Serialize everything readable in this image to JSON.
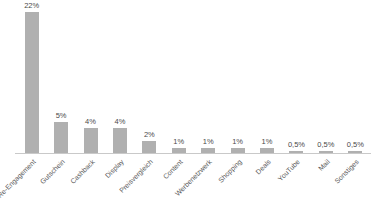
{
  "chart_data": {
    "type": "bar",
    "title": "",
    "subtitle": "",
    "xlabel": "",
    "ylabel": "",
    "grid": false,
    "legend": false,
    "ylim": [
      0,
      23
    ],
    "categories": [
      "Re-Engagement",
      "Gutschein",
      "Cashback",
      "Display",
      "Preisvergleich",
      "Content",
      "Werbenetzwerk",
      "Shopping",
      "Deals",
      "YouTube",
      "Mail",
      "Sonstiges"
    ],
    "values": [
      22,
      5,
      4,
      4,
      2,
      1,
      1,
      1,
      1,
      0.5,
      0.5,
      0.5
    ],
    "data_labels": [
      "22%",
      "5%",
      "4%",
      "4%",
      "2%",
      "1%",
      "1%",
      "1%",
      "1%",
      "0,5%",
      "0,5%",
      "0,5%"
    ],
    "colors": {
      "bar": "#b0b0b0",
      "axis": "#c9c9c9",
      "label_text": "#4a4a4a",
      "tick_text": "#5a5a5a",
      "background": "#ffffff"
    }
  }
}
